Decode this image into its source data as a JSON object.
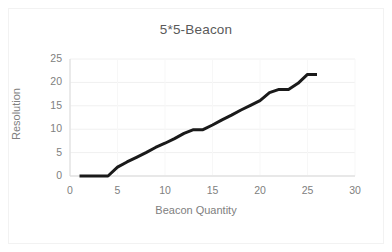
{
  "figure": {
    "background_color": "#ffffff",
    "border_color": "#f2f2f2",
    "title": "5*5-Beacon",
    "title_color": "#5a5a5a",
    "tick_color": "#808080",
    "gridline_color": "#f0f0f0",
    "axis_line_color": "#d9d9d9",
    "series_color": "#1a1a1a"
  },
  "chart_data": {
    "type": "line",
    "title": "5*5-Beacon",
    "xlabel": "Beacon Quantity",
    "ylabel": "Resolution",
    "xlim": [
      0,
      30
    ],
    "ylim": [
      0,
      25
    ],
    "xticks": [
      0,
      5,
      10,
      15,
      20,
      25,
      30
    ],
    "yticks": [
      0,
      5,
      10,
      15,
      20,
      25
    ],
    "xtick_labels": [
      "0",
      "5",
      "10",
      "15",
      "20",
      "25",
      "30"
    ],
    "ytick_labels": [
      "0",
      "5",
      "10",
      "15",
      "20",
      "25"
    ],
    "grid": "horizontal",
    "legend": "none",
    "markers": "none",
    "line_width": 3,
    "series": [
      {
        "name": "5*5-Beacon",
        "color": "#1a1a1a",
        "x": [
          1,
          2,
          3,
          4,
          5,
          6,
          7,
          8,
          9,
          10,
          11,
          12,
          13,
          14,
          15,
          16,
          17,
          18,
          19,
          20,
          21,
          22,
          23,
          24,
          25,
          26
        ],
        "y": [
          0,
          0,
          0,
          0,
          1.9,
          3.0,
          4.0,
          5.0,
          6.1,
          7.0,
          8.0,
          9.1,
          9.9,
          9.9,
          10.9,
          12.0,
          13.0,
          14.1,
          15.1,
          16.1,
          17.8,
          18.5,
          18.5,
          19.8,
          21.7,
          21.7
        ]
      }
    ]
  }
}
